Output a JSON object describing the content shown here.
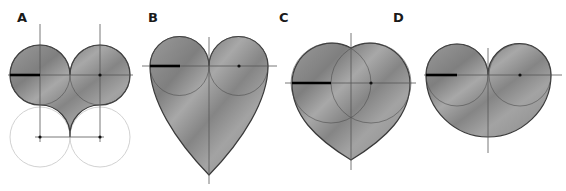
{
  "figures": [
    {
      "label": "A",
      "description": "Two tangent circles with cusped bottom formed by two lower circles"
    },
    {
      "label": "B",
      "description": "Two tangent circles with tall pointed heart"
    },
    {
      "label": "C",
      "description": "Two overlapping circles forming rounded heart"
    },
    {
      "label": "D",
      "description": "Two tangent circles with rounded shallow heart"
    }
  ],
  "colors": {
    "fill": "#8f8f8f",
    "outline": "#3a3a3a",
    "construction": "#555555",
    "faint_circle": "#d2d2d2",
    "radius_mark": "#000000"
  }
}
